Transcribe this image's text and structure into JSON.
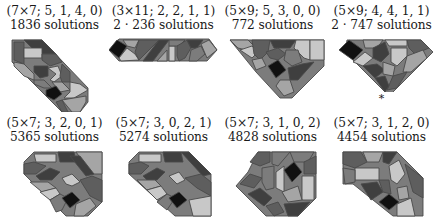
{
  "figure": {
    "panels": [
      {
        "params": "(7×7; 5, 1, 4, 0)",
        "count": "1836 solutions",
        "marker": ""
      },
      {
        "params": "(3×11; 2, 2, 1, 1)",
        "count": "2 · 236 solutions",
        "marker": ""
      },
      {
        "params": "(5×9; 5, 3, 0, 0)",
        "count": "772 solutions",
        "marker": ""
      },
      {
        "params": "(5×9; 4, 4, 1, 1)",
        "count": "2 · 747 solutions",
        "marker": "*"
      },
      {
        "params": "(5×7; 3, 2, 0, 1)",
        "count": "5365 solutions",
        "marker": ""
      },
      {
        "params": "(5×7; 3, 0, 2, 1)",
        "count": "5274 solutions",
        "marker": ""
      },
      {
        "params": "(5×7; 3, 1, 0, 2)",
        "count": "4828 solutions",
        "marker": ""
      },
      {
        "params": "(5×7; 3, 1, 2, 0)",
        "count": "4454 solutions",
        "marker": ""
      }
    ]
  },
  "colors": {
    "black": "#111111",
    "dark": "#3f3f3f",
    "mid_dark": "#5e5e5e",
    "mid": "#7c7c7c",
    "light": "#a5a5a5",
    "lighter": "#c8c8c8",
    "outline": "#4a4a4a"
  }
}
